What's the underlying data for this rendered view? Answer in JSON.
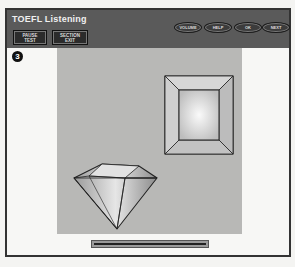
{
  "header": {
    "title": "TOEFL Listening",
    "buttons_left": [
      {
        "label_line1": "PAUSE",
        "label_line2": "TEST"
      },
      {
        "label_line1": "SECTION",
        "label_line2": "EXIT"
      }
    ],
    "buttons_right": [
      {
        "label": "VOLUME"
      },
      {
        "label": "HELP"
      },
      {
        "label": "OK"
      },
      {
        "label": "NEXT"
      }
    ]
  },
  "question": {
    "number": "3"
  },
  "figures": [
    {
      "name": "square-frustum-top-view"
    },
    {
      "name": "diamond-gem"
    }
  ],
  "progress": {
    "percent": 100
  },
  "colors": {
    "header_bg": "#5a5a5a",
    "panel_bg": "#b8b8b6",
    "page_bg": "#f7f7f5"
  }
}
